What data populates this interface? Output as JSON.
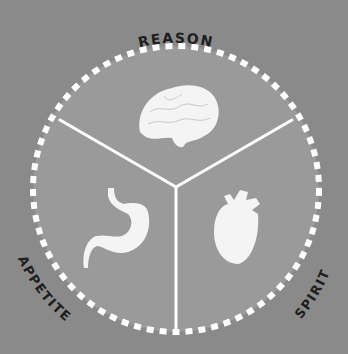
{
  "diagram": {
    "colors": {
      "background": "#8a8a8a",
      "disc": "#9a9a9a",
      "ring": "#ffffff",
      "divider": "#ffffff",
      "icon": "#f4f4f4",
      "label": "#1e1e1e"
    },
    "segments": [
      {
        "label": "REASON",
        "icon": "brain-icon"
      },
      {
        "label": "APPETITE",
        "icon": "stomach-icon"
      },
      {
        "label": "SPIRIT",
        "icon": "heart-icon"
      }
    ]
  }
}
